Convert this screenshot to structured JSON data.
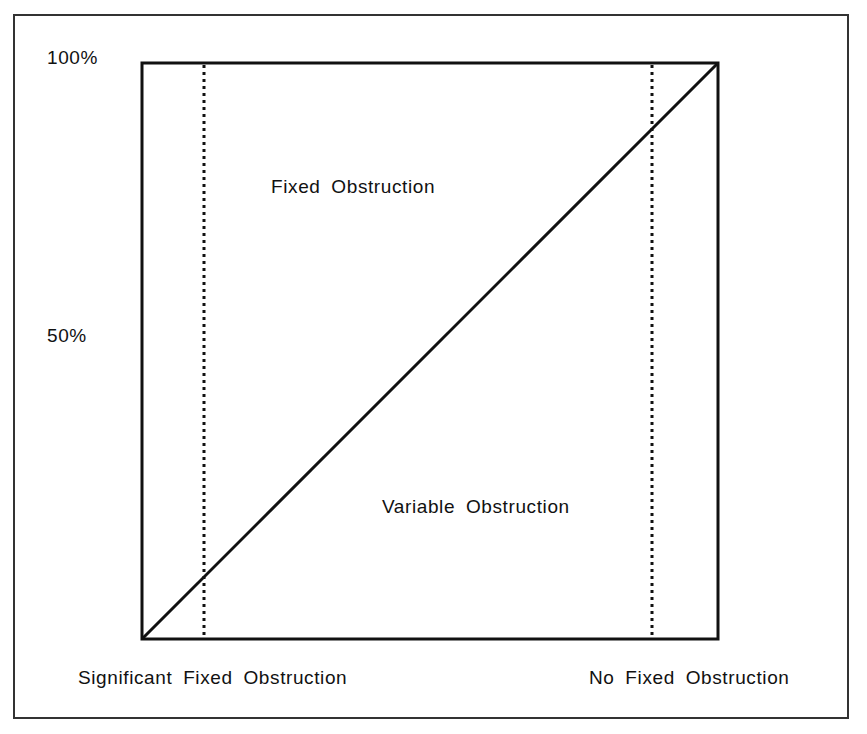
{
  "diagram": {
    "y_axis": {
      "tick_top": "100%",
      "tick_mid": "50%"
    },
    "x_axis": {
      "left_label": "Significant Fixed Obstruction",
      "right_label": "No Fixed Obstruction"
    },
    "regions": {
      "upper": "Fixed Obstruction",
      "lower": "Variable Obstruction"
    },
    "elements": {
      "diagonal": "line from bottom-left (0%) to top-right (100%)",
      "dotted_lines": [
        "left vertical dotted boundary",
        "right vertical dotted boundary"
      ]
    }
  }
}
